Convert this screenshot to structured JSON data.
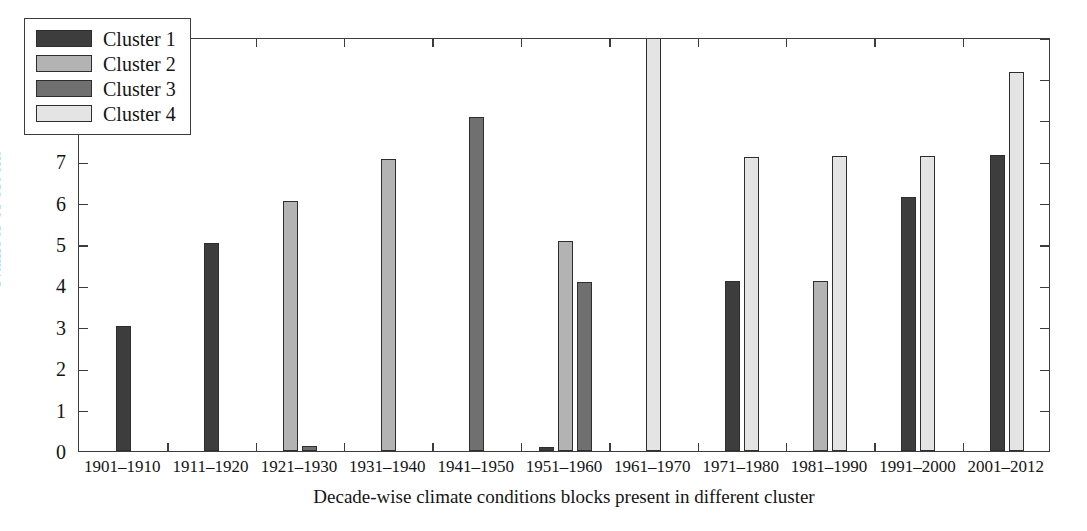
{
  "chart_data": {
    "type": "bar",
    "title": "",
    "xlabel": "Decade-wise climate conditions blocks present in different cluster",
    "ylabel": "Number of blocks",
    "ylim": [
      0,
      10
    ],
    "ytick_labels": [
      "0",
      "1",
      "2",
      "3",
      "4",
      "5",
      "6",
      "7",
      "8",
      "9",
      "10"
    ],
    "ytick_values": [
      0,
      1,
      2,
      3,
      4,
      5,
      6,
      7,
      8,
      9,
      10
    ],
    "grid": false,
    "legend_position": "upper-left",
    "categories": [
      "1901–1910",
      "1911–1920",
      "1921–1930",
      "1931–1940",
      "1941–1950",
      "1951–1960",
      "1961–1970",
      "1971–1980",
      "1981–1990",
      "1991–2000",
      "2001–2012"
    ],
    "series": [
      {
        "name": "Cluster 1",
        "color": "#3d3d3d",
        "values": [
          3.02,
          5.02,
          0,
          0,
          0,
          0.1,
          0,
          4.1,
          0,
          6.13,
          7.15
        ]
      },
      {
        "name": "Cluster 2",
        "color": "#b3b3b3",
        "values": [
          0,
          0,
          6.03,
          7.05,
          0,
          5.07,
          0,
          0,
          4.1,
          0,
          0
        ]
      },
      {
        "name": "Cluster 3",
        "color": "#707070",
        "values": [
          0,
          0,
          0.12,
          0,
          8.07,
          4.08,
          0,
          0,
          0,
          0,
          0
        ]
      },
      {
        "name": "Cluster 4",
        "color": "#e4e4e4",
        "values": [
          0,
          0,
          0,
          0,
          0,
          0,
          10.0,
          7.1,
          7.12,
          7.13,
          9.15
        ]
      }
    ]
  },
  "legend": {
    "entries": [
      {
        "label": "Cluster 1",
        "color": "#3d3d3d"
      },
      {
        "label": "Cluster 2",
        "color": "#b3b3b3"
      },
      {
        "label": "Cluster 3",
        "color": "#707070"
      },
      {
        "label": "Cluster 4",
        "color": "#e4e4e4"
      }
    ]
  },
  "axes": {
    "frame_color": "#3c3c3c",
    "bar_edge_color": "#2e2e2e",
    "background": "#ffffff"
  }
}
